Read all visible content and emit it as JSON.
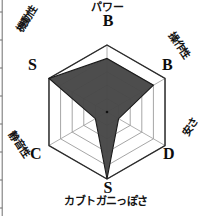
{
  "chart_data": {
    "type": "radar",
    "title": "",
    "subtitle": "",
    "xlabel": "",
    "ylabel": "",
    "grid": true,
    "legend_position": "none",
    "rings": 5,
    "scale_min": 0,
    "scale_max": 5,
    "grade_scale": [
      "E",
      "D",
      "C",
      "B",
      "A",
      "S"
    ],
    "axes": [
      {
        "id": "power",
        "label": "パワー",
        "grade": "B",
        "value": 4,
        "angle_deg": 90
      },
      {
        "id": "control",
        "label": "操作性",
        "grade": "B",
        "value": 4,
        "angle_deg": 30
      },
      {
        "id": "cheap",
        "label": "安さ",
        "grade": "D",
        "value": 1,
        "angle_deg": -30
      },
      {
        "id": "crab",
        "label": "カブトガニっぽさ",
        "grade": "S",
        "value": 5,
        "angle_deg": -90
      },
      {
        "id": "quiet",
        "label": "静音性",
        "grade": "C",
        "value": 1,
        "angle_deg": -150
      },
      {
        "id": "mobility",
        "label": "機動性",
        "grade": "S",
        "value": 5,
        "angle_deg": 150
      }
    ],
    "categories": [
      "パワー",
      "操作性",
      "安さ",
      "カブトガニっぽさ",
      "静音性",
      "機動性"
    ],
    "values": [
      4,
      4,
      1,
      5,
      1,
      5
    ],
    "grades": [
      "B",
      "B",
      "D",
      "S",
      "C",
      "S"
    ],
    "series": [
      {
        "name": "",
        "values": [
          4,
          4,
          1,
          5,
          1,
          5
        ]
      }
    ],
    "colors": {
      "fill": "#474747",
      "fill_outline": "#1a1a1a",
      "grid_line": "#8c8c8c",
      "outer_line": "#2b2b2b",
      "text": "#0d0d0d",
      "background": "#ffffff"
    }
  },
  "geometry": {
    "center_x": 107,
    "center_y": 112,
    "outer_radius": 67
  }
}
